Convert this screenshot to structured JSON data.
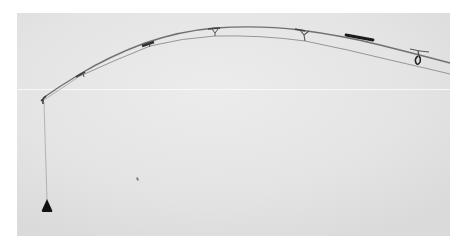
{
  "image": {
    "description": "Grayscale photograph of a fishing rod bent in an arc, line running through guides and hanging vertically to a sinker",
    "colors": {
      "page_background": "#ffffff",
      "photo_background": "#e3e3e3",
      "photo_highlight": "#ececec",
      "rod": "#6e6e6e",
      "line": "#8a8a8a",
      "guide": "#4a4a4a",
      "grip": "#1a1a1a",
      "sinker": "#111111",
      "scratch": "#f7f7f7"
    },
    "frame": {
      "x": 17,
      "y": 13,
      "width": 433,
      "height": 223
    },
    "objects": [
      {
        "name": "rod",
        "type": "curve"
      },
      {
        "name": "fishing-line",
        "type": "curve"
      },
      {
        "name": "line-guides",
        "count": 5
      },
      {
        "name": "rod-grip",
        "type": "bar"
      },
      {
        "name": "reel-loop",
        "type": "guide"
      },
      {
        "name": "rod-tip",
        "type": "guide"
      },
      {
        "name": "hanging-line",
        "type": "line"
      },
      {
        "name": "sinker",
        "type": "weight"
      },
      {
        "name": "speck",
        "type": "dust"
      }
    ]
  }
}
